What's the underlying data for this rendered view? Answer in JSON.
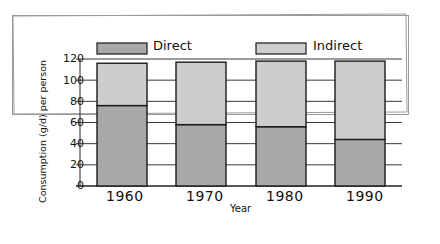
{
  "chart_data": {
    "type": "bar",
    "stacked": true,
    "title": "",
    "xlabel": "Year",
    "ylabel": "Consumption (g/d) per person",
    "categories": [
      "1960",
      "1970",
      "1980",
      "1990"
    ],
    "series": [
      {
        "name": "Direct",
        "values": [
          76,
          58,
          56,
          44
        ],
        "color": "#a8a8a8"
      },
      {
        "name": "Indirect",
        "values": [
          40,
          59,
          62,
          74
        ],
        "color": "#cdcdcd"
      }
    ],
    "ylim": [
      0,
      120
    ],
    "yticks": [
      0,
      20,
      40,
      60,
      80,
      100,
      120
    ],
    "grid": true,
    "legend_position": "top"
  },
  "legend": {
    "direct_label": "Direct",
    "indirect_label": "Indirect"
  },
  "axes": {
    "ylabel": "Consumption (g/d) per person",
    "xlabel": "Year",
    "yticks": [
      "0",
      "20",
      "40",
      "60",
      "80",
      "100",
      "120"
    ],
    "categories": [
      "1960",
      "1970",
      "1980",
      "1990"
    ]
  }
}
